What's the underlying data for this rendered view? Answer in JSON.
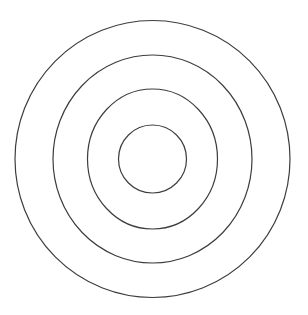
{
  "figure": {
    "canvas": {
      "width": 308,
      "height": 315,
      "background": "#ffffff"
    },
    "stroke_color": "#3d3d3d",
    "stroke_width": 1.2,
    "center": {
      "x": 152.5,
      "y": 159
    },
    "circles": [
      {
        "name": "outer-circle",
        "rx": 137.5,
        "ry": 138.5
      },
      {
        "name": "second-circle",
        "rx": 99.5,
        "ry": 104
      },
      {
        "name": "third-circle",
        "rx": 65,
        "ry": 70
      },
      {
        "name": "inner-circle",
        "rx": 34,
        "ry": 34
      }
    ]
  }
}
